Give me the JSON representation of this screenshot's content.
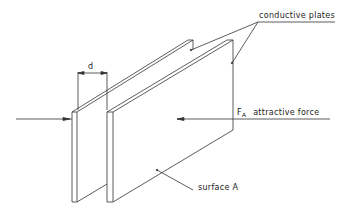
{
  "diagram": {
    "type": "technical-line-drawing",
    "labels": {
      "plates": "conductive plates",
      "gap": "d",
      "force_symbol": "F",
      "force_subscript": "A",
      "force_text": "attractive force",
      "surface": "surface A"
    },
    "colors": {
      "line": "#333333",
      "background": "#ffffff"
    }
  }
}
